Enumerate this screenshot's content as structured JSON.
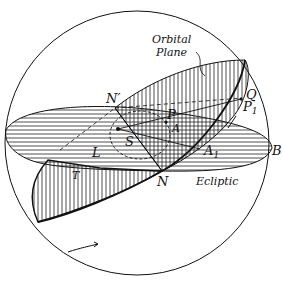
{
  "figure": {
    "title_labels": {
      "orbital_plane_line1": "Orbital",
      "orbital_plane_line2": "Plane",
      "ecliptic": "Ecliptic"
    },
    "points": {
      "N_prime": "N′",
      "N": "N",
      "P": "P",
      "A": "A",
      "S": "S",
      "L": "L",
      "A1": "A",
      "A1_sub": "1",
      "B": "B",
      "Q": "Q",
      "P1": "P",
      "P1_sub": "1",
      "T": "T"
    },
    "colors": {
      "ink": "#111111",
      "background": "#ffffff"
    }
  }
}
